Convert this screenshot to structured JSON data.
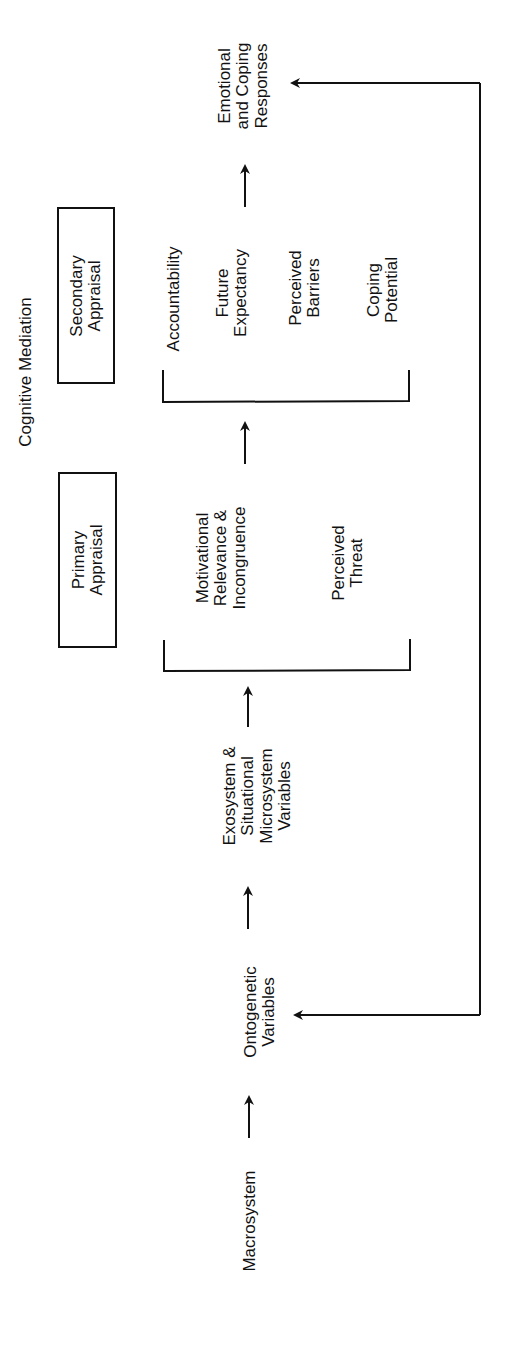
{
  "diagram": {
    "title": "Cognitive Mediation",
    "nodes": {
      "macrosystem": "Macrosystem",
      "ontogenetic": "Ontogenetic\nVariables",
      "exosystem": "Exosystem &\nSituational\nMicrosystem\nVariables",
      "primary_appraisal": "Primary\nAppraisal",
      "secondary_appraisal": "Secondary\nAppraisal",
      "motivational": "Motivational\nRelevance &\nIncongruence",
      "perceived_threat": "Perceived\nThreat",
      "accountability": "Accountability",
      "future_expectancy": "Future\nExpectancy",
      "perceived_barriers": "Perceived\nBarriers",
      "coping_potential": "Coping\nPotential",
      "emotional_responses": "Emotional\nand Coping\nResponses"
    },
    "flow": [
      "Macrosystem",
      "Ontogenetic Variables",
      "Exosystem & Situational Microsystem Variables",
      "Primary Appraisal (Motivational Relevance & Incongruence, Perceived Threat)",
      "Secondary Appraisal (Accountability, Future Expectancy, Perceived Barriers, Coping Potential)",
      "Emotional and Coping Responses"
    ],
    "feedback": "Emotional and Coping Responses <-> Ontogenetic Variables",
    "colors": {
      "ink": "#111111",
      "background": "#ffffff"
    }
  }
}
